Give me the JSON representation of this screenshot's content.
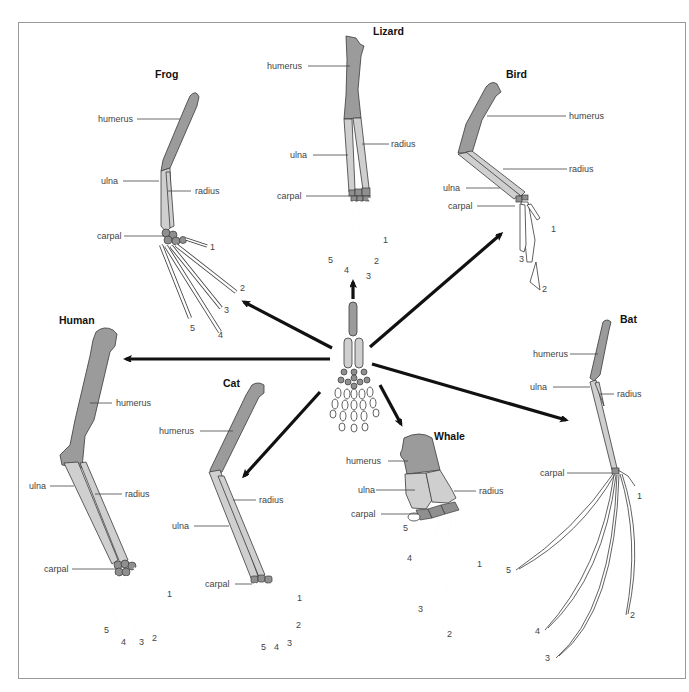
{
  "diagram": {
    "center_label": "",
    "animals": [
      {
        "name": "Frog",
        "labels": [
          "humerus",
          "ulna",
          "radius",
          "carpal"
        ],
        "digits": [
          "1",
          "2",
          "3",
          "4",
          "5"
        ]
      },
      {
        "name": "Lizard",
        "labels": [
          "humerus",
          "ulna",
          "radius",
          "carpal"
        ],
        "digits": [
          "1",
          "2",
          "3",
          "4",
          "5"
        ]
      },
      {
        "name": "Bird",
        "labels": [
          "humerus",
          "radius",
          "ulna",
          "carpal"
        ],
        "digits": [
          "1",
          "3",
          "2"
        ]
      },
      {
        "name": "Human",
        "labels": [
          "humerus",
          "ulna",
          "radius",
          "carpal"
        ],
        "digits": [
          "1",
          "2",
          "3",
          "4",
          "5"
        ]
      },
      {
        "name": "Cat",
        "labels": [
          "humerus",
          "radius",
          "ulna",
          "carpal"
        ],
        "digits": [
          "1",
          "2",
          "3",
          "4",
          "5"
        ]
      },
      {
        "name": "Whale",
        "labels": [
          "humerus",
          "ulna",
          "radius",
          "carpal"
        ],
        "digits": [
          "5",
          "4",
          "1",
          "3",
          "2"
        ]
      },
      {
        "name": "Bat",
        "labels": [
          "humerus",
          "ulna",
          "radius",
          "carpal"
        ],
        "digits": [
          "1",
          "5",
          "2",
          "4",
          "3"
        ]
      }
    ],
    "colors": {
      "humerus": "#9b9b9b",
      "radius_ulna": "#cfcfcf",
      "carpal": "#8f8f8f",
      "digits": "#ffffff",
      "arrows": "#111111",
      "frame": "#9a9a9a"
    }
  }
}
